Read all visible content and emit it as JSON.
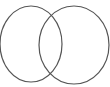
{
  "diagram": {
    "type": "venn",
    "stroke_color": "#555555",
    "background": "#ffffff",
    "circles": [
      {
        "name": "left-set",
        "cx": 31,
        "cy": 44,
        "rx": 31,
        "ry": 38
      },
      {
        "name": "right-set",
        "cx": 74,
        "cy": 45,
        "rx": 35,
        "ry": 39
      }
    ]
  }
}
